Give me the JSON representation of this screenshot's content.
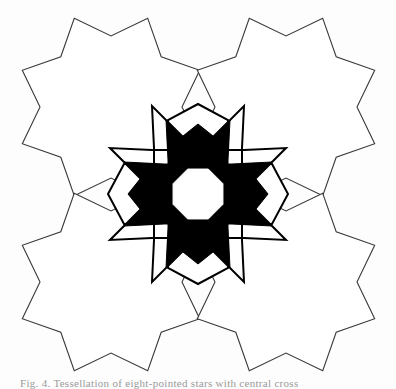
{
  "figure": {
    "width": 396,
    "height": 389,
    "background_color": "#fdfdfd",
    "stroke_color": "#3a3a3a",
    "fill_color": "#ffffff",
    "motif_color": "#000000",
    "stroke_width": 1.1
  },
  "caption": {
    "text": "Fig. 4. Tessellation of eight-pointed stars with central cross",
    "visible_portion": "clipped at bottom edge"
  },
  "pattern_data": {
    "type": "geometric-tessellation",
    "description": "Four overlapping eight-pointed stars (octagrams) arranged in a 2x2 grid, with a solid black quatrefoil cross motif centred on their mutual intersection, enclosing a white octagon.",
    "element_count": 5,
    "star": {
      "name": "eight-pointed-star",
      "points": 8,
      "outer_radius": 96,
      "inner_radius": 71,
      "rotation_deg": 22.5,
      "fill": "#ffffff",
      "stroke": "#3a3a3a"
    },
    "star_centers": [
      {
        "label": "top-left",
        "cx": 111,
        "cy": 107
      },
      {
        "label": "top-right",
        "cx": 286,
        "cy": 107
      },
      {
        "label": "bottom-left",
        "cx": 111,
        "cy": 282
      },
      {
        "label": "bottom-right",
        "cx": 286,
        "cy": 282
      }
    ],
    "intersections": [
      {
        "label": "center",
        "x": 198,
        "y": 194
      },
      {
        "label": "top",
        "x": 198,
        "y": 106
      },
      {
        "label": "bottom",
        "x": 198,
        "y": 282
      },
      {
        "label": "left",
        "x": 111,
        "y": 194
      },
      {
        "label": "right",
        "x": 286,
        "y": 194
      }
    ],
    "cross_motif": {
      "name": "central-cross",
      "cx": 198,
      "cy": 194,
      "arm_span_x": [
        118,
        278
      ],
      "arm_span_y": [
        122,
        266
      ],
      "fill": "#000000",
      "band_fill": "#ffffff",
      "outline_stroke": "#000000"
    },
    "center_octagon": {
      "name": "center-octagon",
      "cx": 198,
      "cy": 194,
      "radius": 27,
      "fill": "#ffffff"
    }
  }
}
